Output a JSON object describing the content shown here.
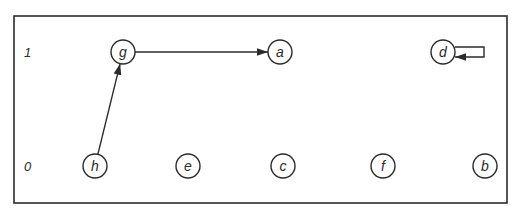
{
  "diagram": {
    "frame": {
      "x": 14,
      "y": 16,
      "width": 493,
      "height": 187
    },
    "levels": [
      {
        "label": "1",
        "x": 24,
        "y": 52
      },
      {
        "label": "0",
        "x": 24,
        "y": 166
      }
    ],
    "node_radius": 12,
    "nodes": [
      {
        "id": "g",
        "label": "g",
        "x": 123,
        "y": 52
      },
      {
        "id": "a",
        "label": "a",
        "x": 280,
        "y": 52
      },
      {
        "id": "d",
        "label": "d",
        "x": 443,
        "y": 52
      },
      {
        "id": "h",
        "label": "h",
        "x": 95,
        "y": 166
      },
      {
        "id": "e",
        "label": "e",
        "x": 188,
        "y": 166
      },
      {
        "id": "c",
        "label": "c",
        "x": 283,
        "y": 166
      },
      {
        "id": "f",
        "label": "f",
        "x": 383,
        "y": 166
      },
      {
        "id": "b",
        "label": "b",
        "x": 485,
        "y": 166
      }
    ],
    "edges": [
      {
        "from": "h",
        "to": "g",
        "type": "straight"
      },
      {
        "from": "g",
        "to": "a",
        "type": "straight"
      },
      {
        "from": "d",
        "to": "d",
        "type": "self-loop"
      }
    ],
    "stroke_color": "#2b2b2b"
  }
}
